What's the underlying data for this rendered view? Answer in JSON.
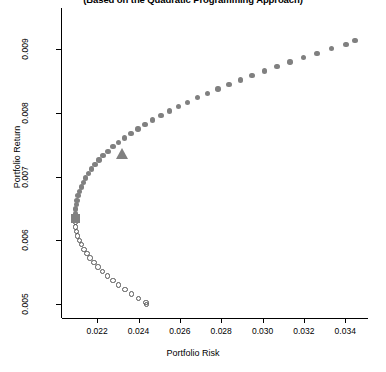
{
  "chart_data": {
    "type": "scatter",
    "title": "(Based on the Quadratic Programming Approach)",
    "xlabel": "Portfolio Risk",
    "ylabel": "Portfolio Return",
    "xlim": [
      0.0203,
      0.0351
    ],
    "ylim": [
      0.00478,
      0.00965
    ],
    "xticks": [
      0.022,
      0.024,
      0.026,
      0.028,
      0.03,
      0.032,
      0.034
    ],
    "xtick_labels": [
      "0.022",
      "0.024",
      "0.026",
      "0.028",
      "0.030",
      "0.032",
      "0.034"
    ],
    "yticks": [
      0.005,
      0.006,
      0.007,
      0.008,
      0.009
    ],
    "ytick_labels": [
      "0.005",
      "0.006",
      "0.007",
      "0.008",
      "0.009"
    ],
    "grid": false,
    "legend": null,
    "series": [
      {
        "name": "Efficient frontier",
        "marker": "filled-circle",
        "color": "#808080",
        "points": [
          [
            0.02094,
            0.00635
          ],
          [
            0.02094,
            0.00642
          ],
          [
            0.02096,
            0.00649
          ],
          [
            0.02099,
            0.00656
          ],
          [
            0.02103,
            0.00663
          ],
          [
            0.02108,
            0.0067
          ],
          [
            0.02115,
            0.00677
          ],
          [
            0.02123,
            0.00684
          ],
          [
            0.02133,
            0.00691
          ],
          [
            0.02144,
            0.00698
          ],
          [
            0.02157,
            0.00705
          ],
          [
            0.02172,
            0.00712
          ],
          [
            0.02189,
            0.00719
          ],
          [
            0.02208,
            0.00726
          ],
          [
            0.02229,
            0.00733
          ],
          [
            0.02252,
            0.0074
          ],
          [
            0.02277,
            0.00747
          ],
          [
            0.02304,
            0.00754
          ],
          [
            0.02333,
            0.00761
          ],
          [
            0.02364,
            0.00768
          ],
          [
            0.02397,
            0.00775
          ],
          [
            0.02432,
            0.00782
          ],
          [
            0.02469,
            0.00789
          ],
          [
            0.02508,
            0.00796
          ],
          [
            0.02549,
            0.00803
          ],
          [
            0.02592,
            0.0081
          ],
          [
            0.02637,
            0.00817
          ],
          [
            0.02684,
            0.00824
          ],
          [
            0.02733,
            0.00831
          ],
          [
            0.02784,
            0.00838
          ],
          [
            0.02837,
            0.00845
          ],
          [
            0.02892,
            0.00852
          ],
          [
            0.02949,
            0.00859
          ],
          [
            0.03008,
            0.00866
          ],
          [
            0.03069,
            0.00873
          ],
          [
            0.03132,
            0.0088
          ],
          [
            0.03197,
            0.00887
          ],
          [
            0.03264,
            0.00894
          ],
          [
            0.03333,
            0.00901
          ],
          [
            0.03404,
            0.00908
          ],
          [
            0.03447,
            0.00914
          ]
        ]
      },
      {
        "name": "Inefficient frontier",
        "marker": "open-circle",
        "color": "#555555",
        "points": [
          [
            0.02094,
            0.00628
          ],
          [
            0.02096,
            0.00621
          ],
          [
            0.021,
            0.00614
          ],
          [
            0.02106,
            0.00607
          ],
          [
            0.02114,
            0.006
          ],
          [
            0.02124,
            0.00593
          ],
          [
            0.02136,
            0.00586
          ],
          [
            0.0215,
            0.00579
          ],
          [
            0.02166,
            0.00572
          ],
          [
            0.02184,
            0.00565
          ],
          [
            0.02204,
            0.00558
          ],
          [
            0.02226,
            0.00551
          ],
          [
            0.0225,
            0.00544
          ],
          [
            0.02276,
            0.00537
          ],
          [
            0.02304,
            0.0053
          ],
          [
            0.02334,
            0.00523
          ],
          [
            0.02366,
            0.00516
          ],
          [
            0.024,
            0.00509
          ],
          [
            0.02436,
            0.00502
          ],
          [
            0.0244,
            0.00499
          ]
        ]
      }
    ],
    "markers": [
      {
        "name": "minimum-variance-portfolio",
        "shape": "square",
        "color": "#808080",
        "x": 0.02094,
        "y": 0.00635
      },
      {
        "name": "tangency-portfolio",
        "shape": "triangle",
        "color": "#808080",
        "x": 0.02322,
        "y": 0.00736
      }
    ]
  }
}
